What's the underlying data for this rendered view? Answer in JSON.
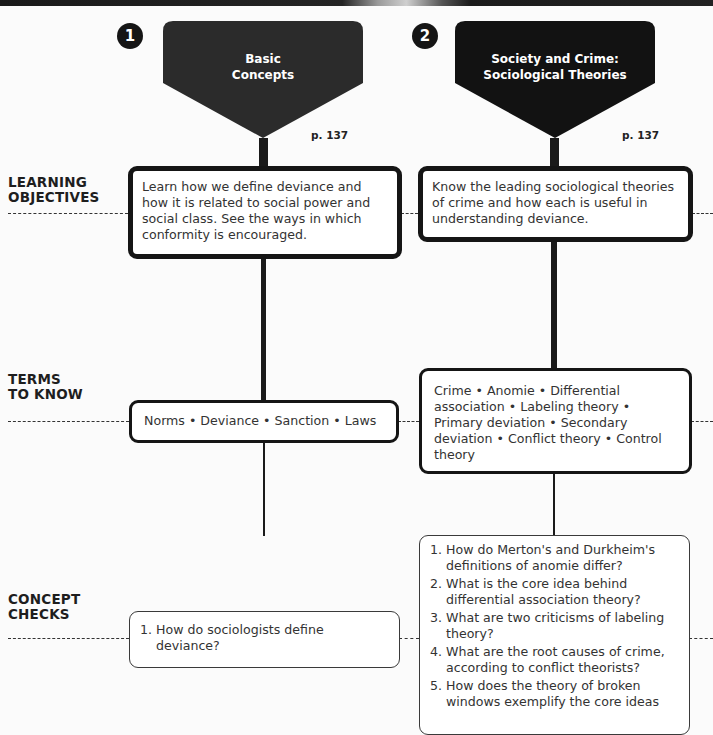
{
  "row_labels": {
    "learning_objectives": [
      "LEARNING",
      "OBJECTIVES"
    ],
    "terms_to_know": [
      "TERMS",
      "TO KNOW"
    ],
    "concept_checks": [
      "CONCEPT",
      "CHECKS"
    ]
  },
  "columns": [
    {
      "number": "1",
      "title_lines": [
        "Basic",
        "Concepts"
      ],
      "page_ref": "p. 137",
      "learning_objective": "Learn how we define deviance and how it is related to social power and social class. See the ways in which conformity is encouraged.",
      "terms": "Norms • Deviance • Sanction • Laws",
      "concept_checks": [
        {
          "num": "1.",
          "text": "How do sociologists define deviance?"
        }
      ]
    },
    {
      "number": "2",
      "title_lines": [
        "Society and Crime:",
        "Sociological Theories"
      ],
      "page_ref": "p. 137",
      "learning_objective": "Know the leading sociological theories of crime and how each is useful in understanding deviance.",
      "terms": "Crime • Anomie • Differential association • Labeling theory • Primary deviation • Secondary deviation • Conflict theory • Control theory",
      "concept_checks": [
        {
          "num": "1.",
          "text": "How do Merton's and Durkheim's definitions of anomie differ?"
        },
        {
          "num": "2.",
          "text": "What is the core idea behind differential association theory?"
        },
        {
          "num": "3.",
          "text": "What are two criticisms of labeling theory?"
        },
        {
          "num": "4.",
          "text": "What are the root causes of crime, according to conflict theorists?"
        },
        {
          "num": "5.",
          "text": "How does the theory of broken windows exemplify the core ideas"
        }
      ]
    }
  ],
  "colors": {
    "header_1": "#2b2b2b",
    "header_2": "#121212",
    "line": "#1a1a1a",
    "background": "#fbfbfb"
  }
}
